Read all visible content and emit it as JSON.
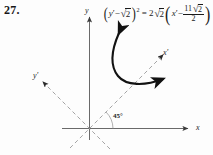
{
  "figure": {
    "problem_number": "27.",
    "equation": {
      "full_text": "(y' - √2)² = 2√2 (x' - 11√2/2)",
      "lhs_var": "y",
      "lhs_prime": "′",
      "lhs_minus": "−",
      "lhs_radicand": "2",
      "lhs_exponent": "2",
      "equals": "=",
      "rhs_coefficient": "2",
      "rhs_radicand": "2",
      "rhs_var": "x",
      "rhs_prime": "′",
      "rhs_minus": "−",
      "frac_numerator_int": "11",
      "frac_numerator_radicand": "2",
      "frac_denominator": "2",
      "radical_symbol": "√",
      "paren_open": "(",
      "paren_close": ")"
    },
    "axes": {
      "y_label": "y",
      "x_label": "x",
      "x_prime_label": "x′",
      "y_prime_label": "y′"
    },
    "angle_label": "45°",
    "colors": {
      "axis": "#555555",
      "curve": "#111111",
      "dashed": "#999999",
      "text": "#1a1a1a",
      "background": "#fdfdfd"
    }
  }
}
